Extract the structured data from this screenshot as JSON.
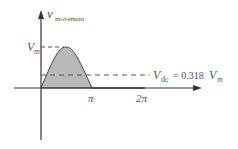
{
  "diagram": {
    "y_axis_label": "v",
    "y_axis_subscript": "movement",
    "peak_label": "V",
    "peak_subscript": "m",
    "dc_label_v": "V",
    "dc_label_sub": "dc",
    "dc_label_eq": "= 0.318",
    "dc_label_vm": "V",
    "dc_label_vm_sub": "m",
    "tick_pi": "π",
    "tick_2pi": "2π",
    "colors": {
      "axis": "#333333",
      "fill": "#b0b0b0",
      "curve": "#444444",
      "dashed": "#555555",
      "text": "#555555"
    }
  }
}
